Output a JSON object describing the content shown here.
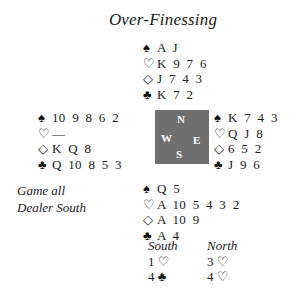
{
  "title": "Over-Finessing",
  "symbols": {
    "spade": "♠",
    "heart": "♡",
    "diamond": "◇",
    "club": "♣"
  },
  "hands": {
    "north": {
      "spades": "A J",
      "hearts": "K 9 7 6",
      "diamonds": "J 7 4 3",
      "clubs": "K 7 2"
    },
    "west": {
      "spades": "10 9 8 6 2",
      "hearts": "—",
      "diamonds": "K Q 8",
      "clubs": "Q 10 8 5 3"
    },
    "east": {
      "spades": "K 7 4 3",
      "hearts": "Q J 8",
      "diamonds": "6 5 2",
      "clubs": "J 9 6"
    },
    "south": {
      "spades": "Q 5",
      "hearts": "A 10 5 4 3 2",
      "diamonds": "A 10 9",
      "clubs": "A 4"
    }
  },
  "compass": {
    "n": "N",
    "w": "W",
    "e": "E",
    "s": "S",
    "color": "#6f6f6f"
  },
  "info": {
    "vulnerability": "Game all",
    "dealer": "Dealer South"
  },
  "auction": {
    "south": {
      "header": "South",
      "bids": [
        "1 ♡",
        "4 ♣"
      ]
    },
    "north": {
      "header": "North",
      "bids": [
        "3 ♡",
        "4 ♡"
      ]
    }
  }
}
